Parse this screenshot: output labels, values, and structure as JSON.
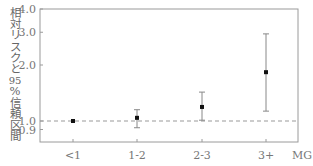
{
  "chart_data": {
    "type": "scatter",
    "subtype": "point-with-error-bars",
    "title": "",
    "xlabel": "MG",
    "ylabel": "相対リスクと95%信頼区間",
    "yscale": "log",
    "ylim": [
      0.85,
      4.0
    ],
    "yticks": [
      0.9,
      1.0,
      2.0,
      3.0,
      4.0
    ],
    "ytick_labels": [
      "0.9",
      "1.0",
      "2.0",
      "3.0",
      "4.0"
    ],
    "categories": [
      "<1",
      "1-2",
      "2-3",
      "3+"
    ],
    "values": [
      1.0,
      1.04,
      1.19,
      1.83
    ],
    "ci_lower": [
      null,
      0.92,
      1.01,
      1.13
    ],
    "ci_upper": [
      null,
      1.15,
      1.43,
      2.94
    ],
    "reference_line": {
      "y": 1.0,
      "style": "dashed"
    },
    "grid": false,
    "legend": null
  },
  "axis": {
    "xlabel": "MG",
    "ylabel_chars": [
      "相",
      "対",
      "リ",
      "ス",
      "ク",
      "と",
      "95",
      "%",
      "信",
      "頼",
      "区",
      "間"
    ]
  }
}
